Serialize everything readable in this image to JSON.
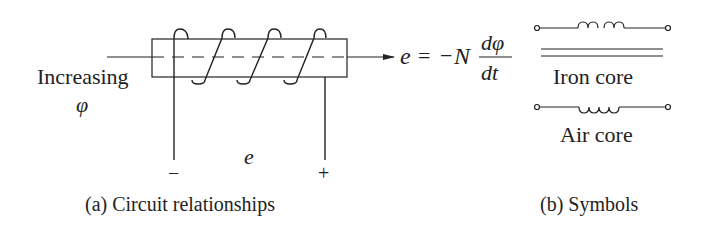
{
  "figure": {
    "panel_a": {
      "flux_label_line1": "Increasing",
      "flux_label_symbol": "φ",
      "emf_label": "e",
      "minus_terminal": "−",
      "plus_terminal": "+",
      "equation": {
        "lhs": "e",
        "equals": "=",
        "sign": "−",
        "coefficient": "N",
        "numerator": "dφ",
        "denominator": "dt"
      },
      "caption": "(a) Circuit relationships"
    },
    "panel_b": {
      "iron_core_label": "Iron core",
      "air_core_label": "Air core",
      "caption": "(b) Symbols"
    },
    "colors": {
      "ink": "#222222",
      "background": "#ffffff"
    }
  }
}
